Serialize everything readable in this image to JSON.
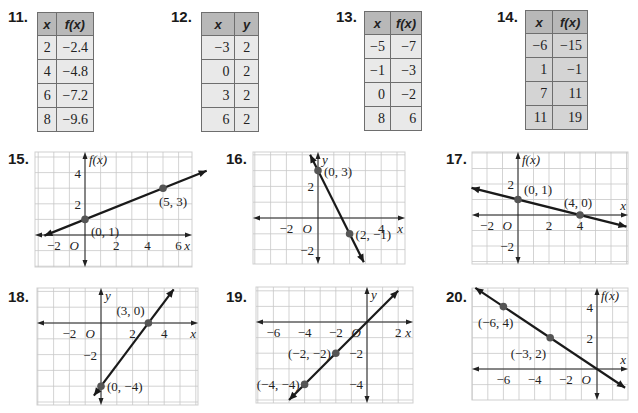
{
  "tables": [
    {
      "number": "11.",
      "headers": [
        "x",
        "f(x)"
      ],
      "rows": [
        [
          "2",
          "−2.4"
        ],
        [
          "4",
          "−4.8"
        ],
        [
          "6",
          "−7.2"
        ],
        [
          "8",
          "−9.6"
        ]
      ]
    },
    {
      "number": "12.",
      "headers": [
        "x",
        "y"
      ],
      "rows": [
        [
          "−3",
          "2"
        ],
        [
          "0",
          "2"
        ],
        [
          "3",
          "2"
        ],
        [
          "6",
          "2"
        ]
      ]
    },
    {
      "number": "13.",
      "headers": [
        "x",
        "f(x)"
      ],
      "rows": [
        [
          "−5",
          "−7"
        ],
        [
          "−1",
          "−3"
        ],
        [
          "0",
          "−2"
        ],
        [
          "8",
          "6"
        ]
      ]
    },
    {
      "number": "14.",
      "headers": [
        "x",
        "f(x)"
      ],
      "rows": [
        [
          "−6",
          "−15"
        ],
        [
          "1",
          "−1"
        ],
        [
          "7",
          "11"
        ],
        [
          "11",
          "19"
        ]
      ]
    }
  ],
  "graphs": [
    {
      "number": "15.",
      "ylabel": "f(x)",
      "xlabel": "x",
      "origin_label": "O",
      "box": {
        "x": 35,
        "y": 152,
        "w": 157,
        "h": 115
      },
      "origin": {
        "x": 85,
        "y": 235
      },
      "cell": 15.6,
      "xticks": [
        {
          "v": -2,
          "t": "−2"
        },
        {
          "v": 2,
          "t": "2"
        },
        {
          "v": 4,
          "t": "4"
        },
        {
          "v": 6,
          "t": "6"
        }
      ],
      "yticks": [
        {
          "v": 2,
          "t": "2"
        },
        {
          "v": 4,
          "t": "4"
        }
      ],
      "points": [
        {
          "x": 0,
          "y": 1,
          "label": "(0, 1)"
        },
        {
          "x": 5,
          "y": 3,
          "label": "(5, 3)"
        }
      ],
      "line": {
        "x1": -2.6,
        "x2": 7.8
      }
    },
    {
      "number": "16.",
      "ylabel": "y",
      "xlabel": "x",
      "origin_label": "O",
      "box": {
        "x": 253,
        "y": 152,
        "w": 152,
        "h": 112
      },
      "origin": {
        "x": 318,
        "y": 218
      },
      "cell": 15.8,
      "xticks": [
        {
          "v": -2,
          "t": "−2"
        },
        {
          "v": 4,
          "t": "4"
        }
      ],
      "yticks": [
        {
          "v": 2,
          "t": "2"
        },
        {
          "v": -2,
          "t": "−2"
        }
      ],
      "points": [
        {
          "x": 0,
          "y": 3,
          "label": "(0, 3)"
        },
        {
          "x": 2,
          "y": -1,
          "label": "(2, −1)"
        }
      ],
      "line": {
        "x1": -0.5,
        "x2": 2.9
      }
    },
    {
      "number": "17.",
      "ylabel": "f(x)",
      "xlabel": "x",
      "origin_label": "O",
      "box": {
        "x": 472,
        "y": 152,
        "w": 156,
        "h": 112
      },
      "origin": {
        "x": 518,
        "y": 215
      },
      "cell": 15.5,
      "xticks": [
        {
          "v": -2,
          "t": "−2"
        },
        {
          "v": 2,
          "t": "2"
        },
        {
          "v": 4,
          "t": "4"
        }
      ],
      "yticks": [
        {
          "v": 2,
          "t": "2"
        },
        {
          "v": -2,
          "t": "−2"
        }
      ],
      "points": [
        {
          "x": 0,
          "y": 1,
          "label": "(0, 1)"
        },
        {
          "x": 4,
          "y": 0,
          "label": "(4, 0)"
        }
      ],
      "line": {
        "x1": -3,
        "x2": 7
      }
    },
    {
      "number": "18.",
      "ylabel": "y",
      "xlabel": "x",
      "origin_label": "O",
      "box": {
        "x": 37,
        "y": 288,
        "w": 161,
        "h": 117
      },
      "origin": {
        "x": 101,
        "y": 323
      },
      "cell": 15.8,
      "xticks": [
        {
          "v": -2,
          "t": "−2"
        },
        {
          "v": 2,
          "t": "2"
        },
        {
          "v": 4,
          "t": "4"
        }
      ],
      "yticks": [
        {
          "v": -2,
          "t": "−2"
        }
      ],
      "points": [
        {
          "x": 3,
          "y": 0,
          "label": "(3, 0)"
        },
        {
          "x": 0,
          "y": -4,
          "label": "(0, −4)"
        }
      ],
      "line": {
        "x1": -0.45,
        "x2": 4.6
      }
    },
    {
      "number": "19.",
      "ylabel": "y",
      "xlabel": "x",
      "origin_label": "O",
      "box": {
        "x": 256,
        "y": 287,
        "w": 157,
        "h": 116
      },
      "origin": {
        "x": 367,
        "y": 322
      },
      "cell": 15.6,
      "xticks": [
        {
          "v": -6,
          "t": "−6"
        },
        {
          "v": -4,
          "t": "−4"
        },
        {
          "v": -2,
          "t": "−2"
        },
        {
          "v": 2,
          "t": "2"
        }
      ],
      "yticks": [
        {
          "v": -2,
          "t": "−2"
        },
        {
          "v": -4,
          "t": "−4"
        }
      ],
      "points": [
        {
          "x": -2,
          "y": -2,
          "label": "(−2, −2)"
        },
        {
          "x": -4,
          "y": -4,
          "label": "(−4, −4)"
        }
      ],
      "line": {
        "x1": -5,
        "x2": 2
      }
    },
    {
      "number": "20.",
      "ylabel": "f(x)",
      "xlabel": "x",
      "origin_label": "O",
      "box": {
        "x": 472,
        "y": 288,
        "w": 156,
        "h": 112
      },
      "origin": {
        "x": 597,
        "y": 369
      },
      "cell": 15.6,
      "xticks": [
        {
          "v": -6,
          "t": "−6"
        },
        {
          "v": -4,
          "t": "−4"
        },
        {
          "v": -2,
          "t": "−2"
        }
      ],
      "yticks": [
        {
          "v": 2,
          "t": "2"
        },
        {
          "v": 4,
          "t": "4"
        }
      ],
      "points": [
        {
          "x": -6,
          "y": 4,
          "label": "(−6, 4)"
        },
        {
          "x": -3,
          "y": 2,
          "label": "(−3, 2)"
        }
      ],
      "line": {
        "x1": -7.8,
        "x2": 1.8
      }
    }
  ],
  "chart_data": [
    {
      "type": "table",
      "title": "11.",
      "columns": [
        "x",
        "f(x)"
      ],
      "rows": [
        [
          2,
          -2.4
        ],
        [
          4,
          -4.8
        ],
        [
          6,
          -7.2
        ],
        [
          8,
          -9.6
        ]
      ]
    },
    {
      "type": "table",
      "title": "12.",
      "columns": [
        "x",
        "y"
      ],
      "rows": [
        [
          -3,
          2
        ],
        [
          0,
          2
        ],
        [
          3,
          2
        ],
        [
          6,
          2
        ]
      ]
    },
    {
      "type": "table",
      "title": "13.",
      "columns": [
        "x",
        "f(x)"
      ],
      "rows": [
        [
          -5,
          -7
        ],
        [
          -1,
          -3
        ],
        [
          0,
          -2
        ],
        [
          8,
          6
        ]
      ]
    },
    {
      "type": "table",
      "title": "14.",
      "columns": [
        "x",
        "f(x)"
      ],
      "rows": [
        [
          -6,
          -15
        ],
        [
          1,
          -1
        ],
        [
          7,
          11
        ],
        [
          11,
          19
        ]
      ]
    },
    {
      "type": "line",
      "title": "15.",
      "xlabel": "x",
      "ylabel": "f(x)",
      "xlim": [
        -3,
        7
      ],
      "ylim": [
        -2,
        5
      ],
      "grid": true,
      "points": [
        [
          0,
          1
        ],
        [
          5,
          3
        ]
      ],
      "labels": [
        "(0, 1)",
        "(5, 3)"
      ],
      "xticks": [
        -2,
        2,
        4,
        6
      ],
      "yticks": [
        2,
        4
      ]
    },
    {
      "type": "line",
      "title": "16.",
      "xlabel": "x",
      "ylabel": "y",
      "xlim": [
        -4,
        5
      ],
      "ylim": [
        -3,
        4
      ],
      "grid": true,
      "points": [
        [
          0,
          3
        ],
        [
          2,
          -1
        ]
      ],
      "labels": [
        "(0, 3)",
        "(2, −1)"
      ],
      "xticks": [
        -2,
        4
      ],
      "yticks": [
        2,
        -2
      ]
    },
    {
      "type": "line",
      "title": "17.",
      "xlabel": "x",
      "ylabel": "f(x)",
      "xlim": [
        -3,
        7
      ],
      "ylim": [
        -3,
        4
      ],
      "grid": true,
      "points": [
        [
          0,
          1
        ],
        [
          4,
          0
        ]
      ],
      "labels": [
        "(0, 1)",
        "(4, 0)"
      ],
      "xticks": [
        -2,
        2,
        4
      ],
      "yticks": [
        2,
        -2
      ]
    },
    {
      "type": "line",
      "title": "18.",
      "xlabel": "x",
      "ylabel": "y",
      "xlim": [
        -4,
        6
      ],
      "ylim": [
        -5,
        2
      ],
      "grid": true,
      "points": [
        [
          3,
          0
        ],
        [
          0,
          -4
        ]
      ],
      "labels": [
        "(3, 0)",
        "(0, −4)"
      ],
      "xticks": [
        -2,
        2,
        4
      ],
      "yticks": [
        -2
      ]
    },
    {
      "type": "line",
      "title": "19.",
      "xlabel": "x",
      "ylabel": "y",
      "xlim": [
        -7,
        3
      ],
      "ylim": [
        -5,
        2
      ],
      "grid": true,
      "points": [
        [
          -2,
          -2
        ],
        [
          -4,
          -4
        ]
      ],
      "labels": [
        "(−2, −2)",
        "(−4, −4)"
      ],
      "xticks": [
        -6,
        -4,
        -2,
        2
      ],
      "yticks": [
        -2,
        -4
      ]
    },
    {
      "type": "line",
      "title": "20.",
      "xlabel": "x",
      "ylabel": "f(x)",
      "xlim": [
        -8,
        2
      ],
      "ylim": [
        -2,
        5
      ],
      "grid": true,
      "points": [
        [
          -6,
          4
        ],
        [
          -3,
          2
        ]
      ],
      "labels": [
        "(−6, 4)",
        "(−3, 2)"
      ],
      "xticks": [
        -6,
        -4,
        -2
      ],
      "yticks": [
        2,
        4
      ]
    }
  ]
}
